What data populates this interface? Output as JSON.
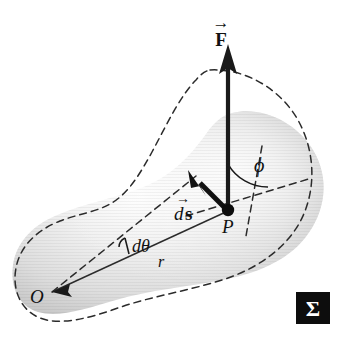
{
  "figure": {
    "background_color": "#ffffff",
    "width": 341,
    "height": 344
  },
  "labels": {
    "force_vector": "F",
    "force_vector_accent": "→",
    "displacement_vector": "d",
    "displacement_vector_bold": "s",
    "displacement_vector_accent": "→",
    "angle_phi": "ϕ",
    "angle_dtheta": "dθ",
    "radius": "r",
    "origin_point": "O",
    "point_p": "P",
    "badge_symbol": "Σ"
  },
  "colors": {
    "body_fill_light": "#f2f2f2",
    "body_fill_mid": "#dcdcdc",
    "body_fill_dark": "#b5b5b5",
    "outline": "#2b2b2b",
    "arrow": "#1a1a1a",
    "dashed": "#2b2b2b",
    "badge_background": "#0d0d0d",
    "badge_text": "#ffffff"
  },
  "geometry": {
    "point_p": {
      "x": 228,
      "y": 210
    },
    "point_o": {
      "x": 52,
      "y": 292
    },
    "force_arrow_tip": {
      "x": 228,
      "y": 45
    },
    "force_arrow_tail": {
      "x": 228,
      "y": 210
    },
    "ds_arrow_tip": {
      "x": 190,
      "y": 172
    },
    "ds_arrow_tail": {
      "x": 226,
      "y": 209
    },
    "phi_arc_radius": 46,
    "badge": {
      "x": 296,
      "y": 292,
      "width": 34,
      "height": 32
    }
  },
  "elements": {
    "solid_body_name": "shaded rigid body",
    "dashed_body_name": "displaced body outline",
    "radius_line_name": "radius line from O to P",
    "dtheta_line_name": "rotated radius line",
    "phi_arc_name": "angle between force and radius"
  }
}
